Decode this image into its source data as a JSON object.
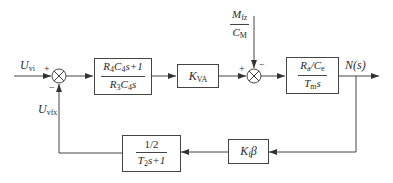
{
  "diagram": {
    "type": "control-block-diagram",
    "signals": {
      "input": {
        "main": "U",
        "sub": "vi"
      },
      "feedback": {
        "main": "U",
        "sub": "vfx"
      },
      "output": "N(s)",
      "disturbance": {
        "num_main": "M",
        "num_sub": "fz",
        "den_main": "C",
        "den_sub": "M"
      }
    },
    "summing_junctions": [
      {
        "id": "sum1",
        "plus": "+",
        "minus": "−"
      },
      {
        "id": "sum2",
        "plus": "+",
        "minus": "−"
      }
    ],
    "blocks": {
      "controller": {
        "num": {
          "a": "R",
          "a_sub": "4",
          "b": "C",
          "b_sub": "4",
          "rest": "s+1"
        },
        "den": {
          "a": "R",
          "a_sub": "3",
          "b": "C",
          "b_sub": "4",
          "rest": "s"
        }
      },
      "amplifier": {
        "main": "K",
        "sub": "VA"
      },
      "plant": {
        "num": {
          "a": "R",
          "a_sub": "a",
          "sep": "/",
          "b": "C",
          "b_sub": "e"
        },
        "den": {
          "a": "T",
          "a_sub": "m",
          "rest": "s"
        }
      },
      "feedback_gain": {
        "main": "K",
        "sub": "f",
        "rest": "β"
      },
      "feedback_filter": {
        "num": "1/2",
        "den": {
          "a": "T",
          "a_sub": "2",
          "rest": "s+1"
        }
      }
    }
  }
}
